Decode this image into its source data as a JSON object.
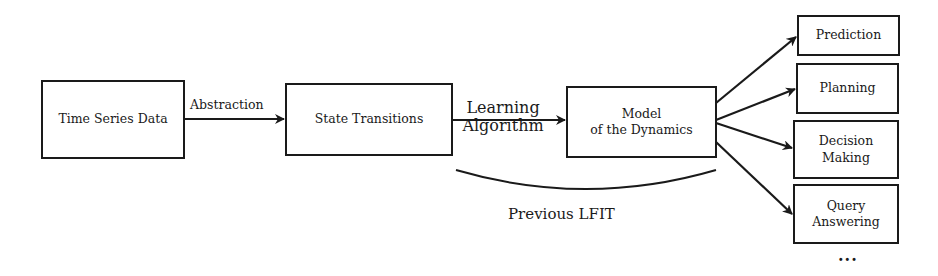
{
  "nodes": {
    "time_series": {
      "label": "Time Series Data"
    },
    "state_transitions": {
      "label": "State Transitions"
    },
    "model": {
      "line1": "Model",
      "line2": "of the Dynamics"
    },
    "prediction": {
      "label": "Prediction"
    },
    "planning": {
      "label": "Planning"
    },
    "decision": {
      "line1": "Decision",
      "line2": "Making"
    },
    "query": {
      "line1": "Query",
      "line2": "Answering"
    }
  },
  "edges": {
    "abstraction": {
      "label": "Abstraction"
    },
    "learning": {
      "line1": "Learning",
      "line2": "Algorithm"
    }
  },
  "annotations": {
    "previous_lfit": "Previous LFIT",
    "ellipsis": "..."
  },
  "colors": {
    "stroke": "#1a1a1a",
    "background": "#ffffff"
  }
}
